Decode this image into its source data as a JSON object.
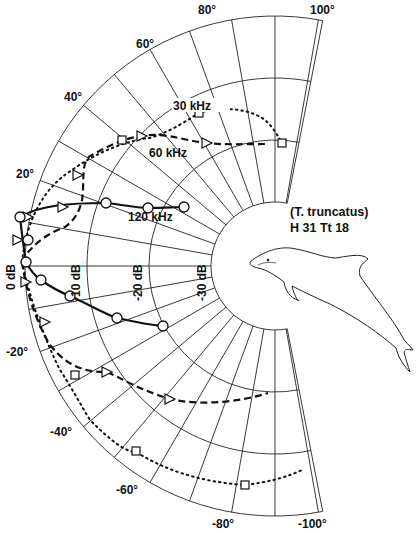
{
  "figure": {
    "species": "(T. truncatus)",
    "specimen_id": "H 31 Tt 18",
    "angle_labels": [
      "100°",
      "80°",
      "60°",
      "40°",
      "20°",
      "-20°",
      "-40°",
      "-60°",
      "-80°",
      "-100°"
    ],
    "db_labels": [
      "0 dB",
      "-10 dB",
      "-20 dB",
      "-30 dB"
    ],
    "curve_labels": {
      "f30": "30 kHz",
      "f60": "60 kHz",
      "f120": "120 kHz"
    }
  },
  "chart_data": {
    "type": "polar",
    "angular_axis": {
      "range_deg": [
        -100,
        100
      ],
      "ticks": [
        100,
        80,
        60,
        40,
        20,
        -20,
        -40,
        -60,
        -80,
        -100
      ],
      "grid_step_deg": 10,
      "zero_direction": "left (rostrum)"
    },
    "radial_axis": {
      "label": "relative sensitivity (dB)",
      "ticks": [
        "0 dB",
        "-10 dB",
        "-20 dB",
        "-30 dB"
      ],
      "range": [
        -30,
        0
      ]
    },
    "series": [
      {
        "name": "30 kHz",
        "style": "dotted",
        "marker": "square",
        "points": [
          {
            "angle": 0,
            "db": 0
          },
          {
            "angle": 25,
            "db": -3
          },
          {
            "angle": 40,
            "db": -5
          },
          {
            "angle": 60,
            "db": -8
          },
          {
            "angle": 90,
            "db": -10
          },
          {
            "angle": -30,
            "db": -3
          },
          {
            "angle": -50,
            "db": -4
          },
          {
            "angle": -80,
            "db": -5
          },
          {
            "angle": -100,
            "db": -6
          }
        ]
      },
      {
        "name": "60 kHz",
        "style": "dashed",
        "marker": "triangle",
        "points": [
          {
            "angle": 0,
            "db": 0
          },
          {
            "angle": 10,
            "db": -3
          },
          {
            "angle": 25,
            "db": -6
          },
          {
            "angle": 40,
            "db": -6
          },
          {
            "angle": 60,
            "db": -10
          },
          {
            "angle": 100,
            "db": -11
          },
          {
            "angle": -10,
            "db": -1
          },
          {
            "angle": -30,
            "db": -6
          },
          {
            "angle": -50,
            "db": -9
          },
          {
            "angle": -90,
            "db": -14
          }
        ]
      },
      {
        "name": "120 kHz",
        "style": "solid",
        "marker": "circle",
        "points": [
          {
            "angle": 0,
            "db": 0
          },
          {
            "angle": 20,
            "db": -11
          },
          {
            "angle": 25,
            "db": -17
          },
          {
            "angle": 33,
            "db": -23
          },
          {
            "angle": -5,
            "db": -1
          },
          {
            "angle": -10,
            "db": -4
          },
          {
            "angle": -20,
            "db": -11
          },
          {
            "angle": -30,
            "db": -18
          },
          {
            "angle": -40,
            "db": -22
          }
        ]
      }
    ]
  }
}
